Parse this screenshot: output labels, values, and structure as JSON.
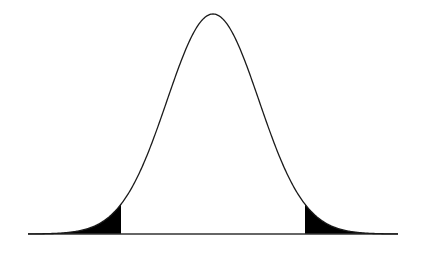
{
  "diagram": {
    "type": "normal-distribution-curve",
    "colors": {
      "curve": "#1a1a1a",
      "shade": "#000000",
      "axis": "#333333",
      "background": "#ffffff"
    },
    "geometry": {
      "baseline_y": 234,
      "axis_x_start": 28,
      "axis_x_end": 398,
      "peak_x": 213,
      "peak_y": 14,
      "sigma_px": 46,
      "left_cutoff_x": 121,
      "right_cutoff_x": 305
    },
    "shaded_regions": [
      "left-tail",
      "right-tail"
    ]
  }
}
